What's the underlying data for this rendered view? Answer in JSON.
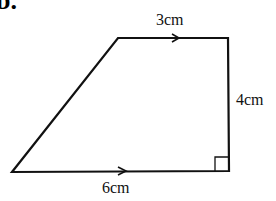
{
  "part_label": "b.",
  "shape": {
    "type": "right trapezium",
    "vertices": [
      [
        118,
        38
      ],
      [
        228,
        38
      ],
      [
        229,
        171
      ],
      [
        12,
        172
      ]
    ],
    "stroke": "#111111"
  },
  "labels": {
    "top": "3cm",
    "right": "4cm",
    "bottom": "6cm"
  },
  "markers": {
    "parallel_arrows": [
      "top",
      "bottom"
    ],
    "right_angle": "bottom-right"
  }
}
